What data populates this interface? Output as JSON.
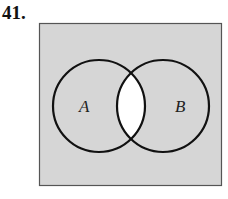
{
  "problem": {
    "number": "41."
  },
  "diagram": {
    "type": "venn",
    "universe_fill": "#d6d6d6",
    "intersection_fill": "#ffffff",
    "stroke": "#111111",
    "sets": [
      {
        "label": "A"
      },
      {
        "label": "B"
      }
    ],
    "shaded_region": "complement of A ∩ B"
  }
}
